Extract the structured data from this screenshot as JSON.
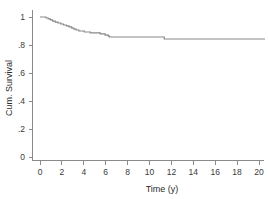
{
  "chart_data": {
    "type": "line",
    "title": "",
    "xlabel": "Time (y)",
    "ylabel": "Cum. Survival",
    "xlim": [
      -0.6,
      21.0
    ],
    "ylim": [
      0,
      1.06
    ],
    "xticks": [
      0,
      2,
      4,
      6,
      8,
      10,
      12,
      14,
      16,
      18,
      20
    ],
    "xticklabels": [
      "0",
      "2",
      "4",
      "6",
      "8",
      "10",
      "12",
      "14",
      "16",
      "18",
      "20"
    ],
    "yticks": [
      0,
      0.2,
      0.4,
      0.6,
      0.8,
      1.0
    ],
    "yticklabels": [
      "0",
      ".2",
      ".4",
      ".6",
      ".8",
      "1"
    ],
    "grid": false,
    "legend": null,
    "series": [
      {
        "name": "Cumulative survival",
        "style": "step-post",
        "color": "#888888",
        "x": [
          0.0,
          0.35,
          0.55,
          0.75,
          0.95,
          1.15,
          1.4,
          1.65,
          1.9,
          2.15,
          2.4,
          2.65,
          2.9,
          3.1,
          3.3,
          3.55,
          3.8,
          4.05,
          4.3,
          4.6,
          4.9,
          5.2,
          5.5,
          5.75,
          5.95,
          6.1,
          6.25,
          6.35,
          11.25,
          11.35,
          20.55
        ],
        "y": [
          1.0,
          1.0,
          0.993,
          0.986,
          0.979,
          0.971,
          0.964,
          0.957,
          0.95,
          0.943,
          0.936,
          0.929,
          0.921,
          0.914,
          0.907,
          0.9,
          0.9,
          0.893,
          0.893,
          0.886,
          0.886,
          0.886,
          0.879,
          0.879,
          0.871,
          0.871,
          0.864,
          0.857,
          0.857,
          0.843,
          0.843
        ]
      }
    ]
  },
  "axes": {
    "x_axis_title": "Time (y)",
    "y_axis_title": "Cum. Survival"
  },
  "colors": {
    "curve": "#888888",
    "axis": "#8a8a8a",
    "text": "#2b2b2b",
    "background": "#ffffff"
  }
}
